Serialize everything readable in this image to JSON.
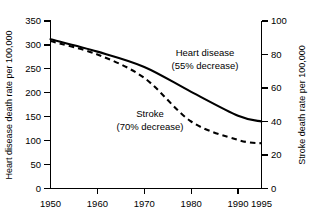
{
  "chart_data": {
    "type": "line",
    "title": "",
    "xlabel": "",
    "x": [
      1950,
      1960,
      1970,
      1980,
      1990,
      1995
    ],
    "xtick_labels": [
      "1950",
      "1960",
      "1970",
      "1980",
      "1990",
      "1995"
    ],
    "grid": false,
    "legend_position": "inline-annotations",
    "left_axis": {
      "label": "Heart disease death rate per 100,000",
      "ylim": [
        0,
        350
      ],
      "ticks": [
        0,
        50,
        100,
        150,
        200,
        250,
        300,
        350
      ],
      "tick_labels": [
        "0",
        "50",
        "100",
        "150",
        "200",
        "250",
        "300",
        "350"
      ]
    },
    "right_axis": {
      "label": "Stroke death rate per 100,000",
      "ylim": [
        0,
        100
      ],
      "ticks": [
        0,
        20,
        40,
        60,
        80,
        100
      ],
      "tick_labels": [
        "0",
        "20",
        "40",
        "60",
        "80",
        "100"
      ]
    },
    "series": [
      {
        "name": "Heart disease",
        "axis": "left",
        "style": "solid",
        "values": [
          312,
          286,
          254,
          202,
          152,
          140
        ],
        "annotation_line1": "Heart disease",
        "annotation_line2": "(55% decrease)"
      },
      {
        "name": "Stroke",
        "axis": "right",
        "style": "dashed",
        "values": [
          88,
          80,
          66,
          40,
          29,
          27
        ],
        "annotation_line1": "Stroke",
        "annotation_line2": "(70% decrease)"
      }
    ],
    "annotations": [
      {
        "text": "Heart disease",
        "x_px": 205,
        "y_px": 56
      },
      {
        "text": "(55% decrease)",
        "x_px": 205,
        "y_px": 69
      },
      {
        "text": "Stroke",
        "x_px": 150,
        "y_px": 117
      },
      {
        "text": "(70% decrease)",
        "x_px": 150,
        "y_px": 130
      }
    ],
    "colors": {
      "line": "#000000",
      "axis": "#000000",
      "background": "#ffffff"
    }
  }
}
